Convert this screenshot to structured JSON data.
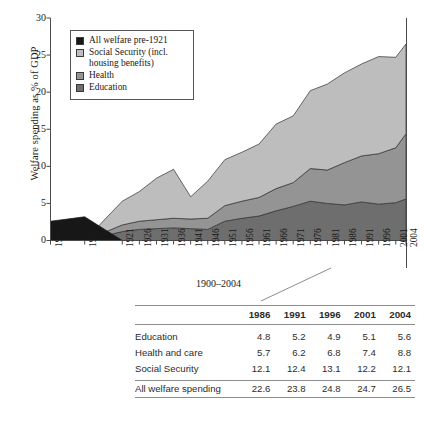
{
  "chart_data": {
    "type": "area",
    "title": "",
    "xlabel": "",
    "ylabel": "Welfare spending as % of GDP",
    "ylim": [
      0,
      30
    ],
    "yticks": [
      0,
      5,
      10,
      15,
      20,
      25,
      30
    ],
    "grid": false,
    "legend_position": "upper-left-inset",
    "x": [
      1900,
      1910,
      1921,
      1926,
      1931,
      1936,
      1941,
      1946,
      1951,
      1956,
      1961,
      1966,
      1971,
      1976,
      1981,
      1986,
      1991,
      1996,
      2001,
      2004
    ],
    "xtick_labels": [
      "1900",
      "1910",
      "1921",
      "1926",
      "1931",
      "1936",
      "1941",
      "1946",
      "1951",
      "1956",
      "1961",
      "1966",
      "1971",
      "1976",
      "1981",
      "1986",
      "1991",
      "1996",
      "2001",
      "2004"
    ],
    "stacked": true,
    "series": [
      {
        "name": "Education",
        "color": "#6e6e6e",
        "values": [
          0,
          0,
          1.2,
          1.5,
          1.6,
          1.7,
          1.6,
          1.5,
          2.6,
          3.0,
          3.3,
          4.0,
          4.6,
          5.3,
          5.0,
          4.8,
          5.2,
          4.9,
          5.1,
          5.6
        ]
      },
      {
        "name": "Health",
        "color": "#949494",
        "values": [
          0,
          0,
          0.9,
          1.1,
          1.2,
          1.3,
          1.3,
          1.5,
          2.1,
          2.3,
          2.5,
          3.0,
          3.2,
          4.4,
          4.5,
          5.7,
          6.2,
          6.8,
          7.4,
          8.8
        ]
      },
      {
        "name": "Social Security (incl. housing benefits)",
        "color": "#bdbdbd",
        "values": [
          0,
          0,
          3.2,
          4.0,
          5.6,
          6.6,
          3.0,
          5.0,
          6.2,
          6.6,
          7.2,
          8.7,
          9.0,
          10.5,
          11.6,
          12.1,
          12.4,
          13.1,
          12.2,
          12.1
        ]
      },
      {
        "name": "All welfare pre-1921",
        "color": "#171717",
        "values": [
          2.6,
          3.2,
          0,
          0,
          0,
          0,
          0,
          0,
          0,
          0,
          0,
          0,
          0,
          0,
          0,
          0,
          0,
          0,
          0,
          0
        ]
      }
    ],
    "legend_entries": [
      {
        "label": "All welfare pre-1921",
        "color": "#171717"
      },
      {
        "label": "Social Security (incl.",
        "label_cont": "housing benefits)",
        "color": "#bdbdbd"
      },
      {
        "label": "Health",
        "color": "#949494"
      },
      {
        "label": "Education",
        "color": "#6e6e6e"
      }
    ]
  },
  "caption": "1900–2004",
  "table": {
    "columns": [
      "1986",
      "1991",
      "1996",
      "2001",
      "2004"
    ],
    "rows": [
      {
        "label": "Education",
        "values": [
          "4.8",
          "5.2",
          "4.9",
          "5.1",
          "5.6"
        ]
      },
      {
        "label": "Health and care",
        "values": [
          "5.7",
          "6.2",
          "6.8",
          "7.4",
          "8.8"
        ]
      },
      {
        "label": "Social Security",
        "values": [
          "12.1",
          "12.4",
          "13.1",
          "12.2",
          "12.1"
        ]
      }
    ],
    "total": {
      "label": "All welfare spending",
      "values": [
        "22.6",
        "23.8",
        "24.8",
        "24.7",
        "26.5"
      ]
    }
  },
  "axis": {
    "y_label": "Welfare spending as % of GDP",
    "y_ticks": [
      "0",
      "5",
      "10",
      "15",
      "20",
      "25",
      "30"
    ]
  }
}
